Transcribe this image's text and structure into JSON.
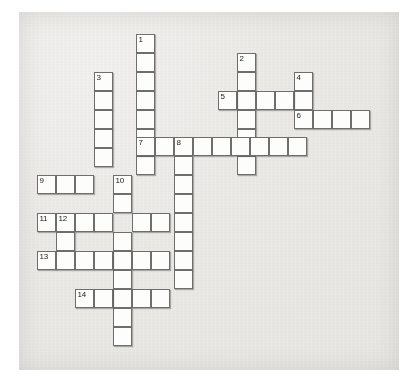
{
  "puzzle": {
    "type": "crossword-grid",
    "title": "",
    "cell_size_px": 19,
    "origin": {
      "x": 37,
      "y": 34
    },
    "paper_color": "#ece9e6",
    "cell_color": "#fdfdfc",
    "border_color": "#6e6e6e",
    "number_color": "#1a1a1a",
    "clue_numbers": [
      1,
      2,
      3,
      4,
      5,
      6,
      7,
      8,
      9,
      10,
      11,
      12,
      13,
      14
    ],
    "entries": [
      {
        "number": 1,
        "direction": "down",
        "col": 5,
        "row": 0,
        "length": 7
      },
      {
        "number": 2,
        "direction": "down",
        "col": 10,
        "row": 2,
        "length": 8
      },
      {
        "number": 3,
        "direction": "down",
        "col": 3,
        "row": 2,
        "length": 6
      },
      {
        "number": 4,
        "direction": "down",
        "col": 13,
        "row": 3,
        "length": 5
      },
      {
        "number": 5,
        "direction": "across",
        "col": 9,
        "row": 4,
        "length": 5
      },
      {
        "number": 6,
        "direction": "across",
        "col": 13,
        "row": 5,
        "length": 4
      },
      {
        "number": 7,
        "direction": "across",
        "col": 5,
        "row": 6,
        "length": 9
      },
      {
        "number": 8,
        "direction": "down",
        "col": 7,
        "row": 6,
        "length": 8
      },
      {
        "number": 9,
        "direction": "across",
        "col": 0,
        "row": 8,
        "length": 5
      },
      {
        "number": 10,
        "direction": "down",
        "col": 4,
        "row": 8,
        "length": 9
      },
      {
        "number": 11,
        "direction": "across",
        "col": 0,
        "row": 10,
        "length": 8
      },
      {
        "number": 12,
        "direction": "down",
        "col": 1,
        "row": 10,
        "length": 3
      },
      {
        "number": 13,
        "direction": "across",
        "col": 0,
        "row": 12,
        "length": 7
      },
      {
        "number": 14,
        "direction": "across",
        "col": 2,
        "row": 14,
        "length": 5
      }
    ],
    "cells": [
      {
        "x": 136,
        "y": 34,
        "num": "1"
      },
      {
        "x": 136,
        "y": 53,
        "num": ""
      },
      {
        "x": 136,
        "y": 72,
        "num": ""
      },
      {
        "x": 136,
        "y": 91,
        "num": ""
      },
      {
        "x": 136,
        "y": 110,
        "num": ""
      },
      {
        "x": 136,
        "y": 129,
        "num": ""
      },
      {
        "x": 136,
        "y": 156,
        "num": ""
      },
      {
        "x": 237,
        "y": 53,
        "num": "2"
      },
      {
        "x": 237,
        "y": 72,
        "num": ""
      },
      {
        "x": 237,
        "y": 91,
        "num": ""
      },
      {
        "x": 237,
        "y": 110,
        "num": ""
      },
      {
        "x": 237,
        "y": 129,
        "num": ""
      },
      {
        "x": 237,
        "y": 156,
        "num": ""
      },
      {
        "x": 94,
        "y": 72,
        "num": "3"
      },
      {
        "x": 94,
        "y": 91,
        "num": ""
      },
      {
        "x": 94,
        "y": 110,
        "num": ""
      },
      {
        "x": 94,
        "y": 129,
        "num": ""
      },
      {
        "x": 94,
        "y": 148,
        "num": ""
      },
      {
        "x": 294,
        "y": 72,
        "num": "4"
      },
      {
        "x": 294,
        "y": 91,
        "num": ""
      },
      {
        "x": 218,
        "y": 91,
        "num": "5"
      },
      {
        "x": 256,
        "y": 91,
        "num": ""
      },
      {
        "x": 275,
        "y": 91,
        "num": ""
      },
      {
        "x": 294,
        "y": 110,
        "num": "6"
      },
      {
        "x": 313,
        "y": 110,
        "num": ""
      },
      {
        "x": 332,
        "y": 110,
        "num": ""
      },
      {
        "x": 351,
        "y": 110,
        "num": ""
      },
      {
        "x": 136,
        "y": 137,
        "num": "7"
      },
      {
        "x": 155,
        "y": 137,
        "num": ""
      },
      {
        "x": 174,
        "y": 137,
        "num": "8"
      },
      {
        "x": 193,
        "y": 137,
        "num": ""
      },
      {
        "x": 212,
        "y": 137,
        "num": ""
      },
      {
        "x": 231,
        "y": 137,
        "num": ""
      },
      {
        "x": 250,
        "y": 137,
        "num": ""
      },
      {
        "x": 269,
        "y": 137,
        "num": ""
      },
      {
        "x": 288,
        "y": 137,
        "num": ""
      },
      {
        "x": 174,
        "y": 156,
        "num": ""
      },
      {
        "x": 174,
        "y": 175,
        "num": ""
      },
      {
        "x": 174,
        "y": 194,
        "num": ""
      },
      {
        "x": 174,
        "y": 213,
        "num": ""
      },
      {
        "x": 174,
        "y": 232,
        "num": ""
      },
      {
        "x": 174,
        "y": 251,
        "num": ""
      },
      {
        "x": 174,
        "y": 270,
        "num": ""
      },
      {
        "x": 37,
        "y": 175,
        "num": "9"
      },
      {
        "x": 56,
        "y": 175,
        "num": ""
      },
      {
        "x": 75,
        "y": 175,
        "num": ""
      },
      {
        "x": 113,
        "y": 175,
        "num": "10"
      },
      {
        "x": 113,
        "y": 194,
        "num": ""
      },
      {
        "x": 113,
        "y": 232,
        "num": ""
      },
      {
        "x": 113,
        "y": 251,
        "num": ""
      },
      {
        "x": 113,
        "y": 270,
        "num": ""
      },
      {
        "x": 113,
        "y": 289,
        "num": ""
      },
      {
        "x": 113,
        "y": 308,
        "num": ""
      },
      {
        "x": 113,
        "y": 327,
        "num": ""
      },
      {
        "x": 37,
        "y": 213,
        "num": "11"
      },
      {
        "x": 56,
        "y": 213,
        "num": "12"
      },
      {
        "x": 75,
        "y": 213,
        "num": ""
      },
      {
        "x": 94,
        "y": 213,
        "num": ""
      },
      {
        "x": 132,
        "y": 213,
        "num": ""
      },
      {
        "x": 151,
        "y": 213,
        "num": ""
      },
      {
        "x": 56,
        "y": 232,
        "num": ""
      },
      {
        "x": 37,
        "y": 251,
        "num": "13"
      },
      {
        "x": 56,
        "y": 251,
        "num": ""
      },
      {
        "x": 75,
        "y": 251,
        "num": ""
      },
      {
        "x": 94,
        "y": 251,
        "num": ""
      },
      {
        "x": 132,
        "y": 251,
        "num": ""
      },
      {
        "x": 151,
        "y": 251,
        "num": ""
      },
      {
        "x": 75,
        "y": 289,
        "num": "14"
      },
      {
        "x": 94,
        "y": 289,
        "num": ""
      },
      {
        "x": 132,
        "y": 289,
        "num": ""
      },
      {
        "x": 151,
        "y": 289,
        "num": ""
      }
    ]
  }
}
